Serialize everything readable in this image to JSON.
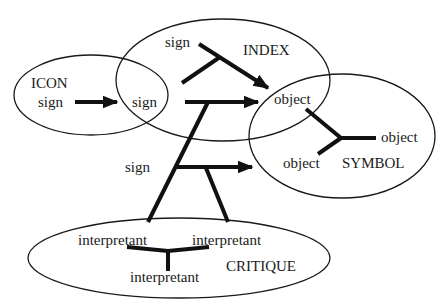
{
  "diagram": {
    "type": "semiotic-sets",
    "colors": {
      "stroke": "#1a1a1a",
      "background": "#ffffff"
    },
    "sets": {
      "icon": {
        "title": "ICON",
        "sign": "sign"
      },
      "index": {
        "title": "INDEX",
        "sign": "sign"
      },
      "symbol": {
        "title": "SYMBOL",
        "object_top": "object",
        "object_right": "object",
        "object_bottom": "object"
      },
      "critique": {
        "title": "CRITIQUE",
        "interpretant_left": "interpretant",
        "interpretant_right": "interpretant",
        "interpretant_bottom": "interpretant"
      }
    },
    "shared": {
      "icon_index_sign": "sign"
    },
    "free_labels": {
      "middle_sign": "sign"
    }
  }
}
